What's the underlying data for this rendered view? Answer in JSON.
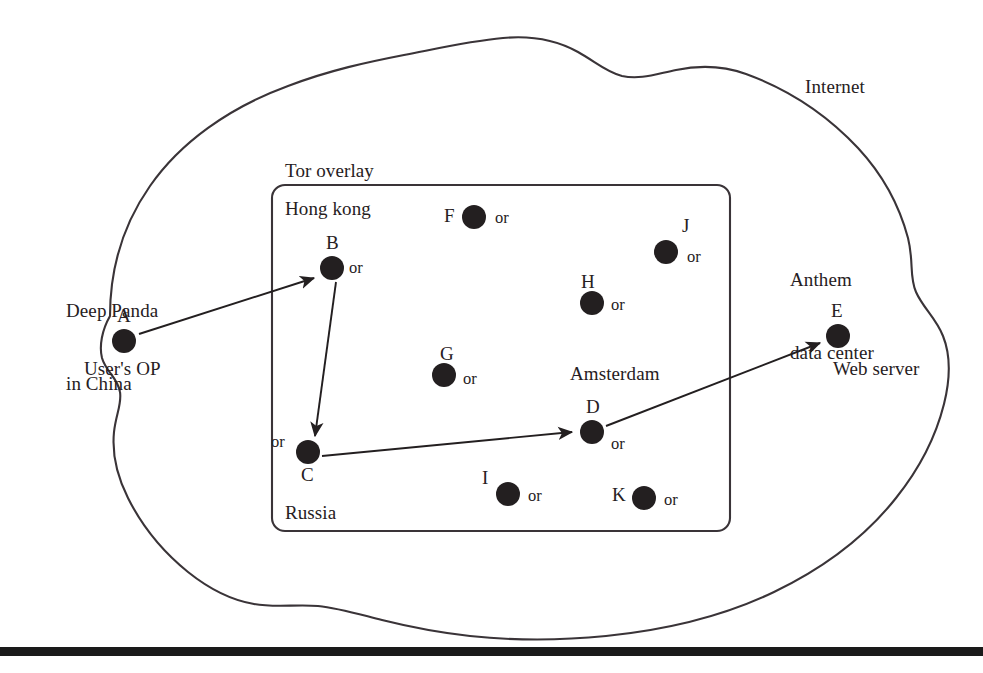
{
  "figure": {
    "title_region_outer": "Internet",
    "type": "network-topology-diagram"
  },
  "cloud": {
    "label": "Internet",
    "stroke": "#3a3438",
    "fill": "#ffffff"
  },
  "tor_box": {
    "label": "Tor overlay",
    "stroke": "#3a3438",
    "regions": [
      {
        "name": "hong-kong",
        "label": "Hong kong"
      },
      {
        "name": "russia",
        "label": "Russia"
      },
      {
        "name": "amsterdam",
        "label": "Amsterdam"
      }
    ]
  },
  "annotations": {
    "attacker": "Deep Panda\nin China",
    "attacker_line1": "Deep Panda",
    "attacker_line2": "in China",
    "target": "Anthem\ndata center",
    "target_line1": "Anthem",
    "target_line2": "data center",
    "user_op": "User's OP",
    "web_server": "Web server"
  },
  "nodes": [
    {
      "id": "A",
      "label": "A",
      "role": "User's OP",
      "or_tag": "",
      "x": 124,
      "y": 341,
      "r": 12,
      "inside_tor": false
    },
    {
      "id": "B",
      "label": "B",
      "role": "Hong kong relay",
      "or_tag": "or",
      "x": 332,
      "y": 268,
      "r": 12,
      "inside_tor": true
    },
    {
      "id": "C",
      "label": "C",
      "role": "Russia relay",
      "or_tag": "or",
      "x": 308,
      "y": 452,
      "r": 12,
      "inside_tor": true
    },
    {
      "id": "D",
      "label": "D",
      "role": "Amsterdam exit relay",
      "or_tag": "or",
      "x": 592,
      "y": 432,
      "r": 12,
      "inside_tor": true
    },
    {
      "id": "E",
      "label": "E",
      "role": "Web server",
      "or_tag": "",
      "x": 838,
      "y": 336,
      "r": 12,
      "inside_tor": false
    },
    {
      "id": "F",
      "label": "F",
      "role": "relay",
      "or_tag": "or",
      "x": 474,
      "y": 217,
      "r": 12,
      "inside_tor": true
    },
    {
      "id": "G",
      "label": "G",
      "role": "relay",
      "or_tag": "or",
      "x": 444,
      "y": 375,
      "r": 12,
      "inside_tor": true
    },
    {
      "id": "H",
      "label": "H",
      "role": "relay",
      "or_tag": "or",
      "x": 592,
      "y": 303,
      "r": 12,
      "inside_tor": true
    },
    {
      "id": "I",
      "label": "I",
      "role": "relay",
      "or_tag": "or",
      "x": 508,
      "y": 494,
      "r": 12,
      "inside_tor": true
    },
    {
      "id": "J",
      "label": "J",
      "role": "relay",
      "or_tag": "or",
      "x": 666,
      "y": 252,
      "r": 12,
      "inside_tor": true
    },
    {
      "id": "K",
      "label": "K",
      "role": "relay",
      "or_tag": "or",
      "x": 644,
      "y": 498,
      "r": 12,
      "inside_tor": true
    }
  ],
  "edges": [
    {
      "from": "A",
      "to": "B",
      "kind": "arrow"
    },
    {
      "from": "B",
      "to": "C",
      "kind": "arrow"
    },
    {
      "from": "C",
      "to": "D",
      "kind": "arrow"
    },
    {
      "from": "D",
      "to": "E",
      "kind": "arrow"
    }
  ],
  "footer_rule": {
    "name": "bottom-rule",
    "color": "#1a1a1a"
  }
}
